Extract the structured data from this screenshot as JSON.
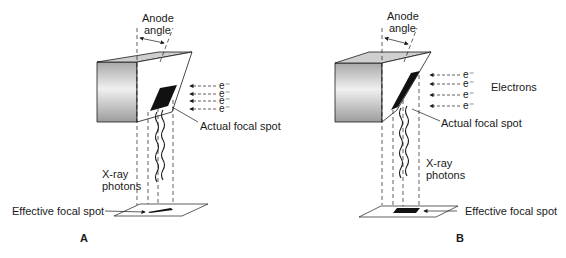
{
  "figure": {
    "panels": [
      {
        "id": "A",
        "panel_label": "A",
        "anode_angle_label_line1": "Anode",
        "anode_angle_label_line2": "angle",
        "electron_symbol": "e⁻",
        "electron_count": 4,
        "actual_focal_spot_label": "Actual focal spot",
        "xray_label_line1": "X-ray",
        "xray_label_line2": "photons",
        "effective_focal_spot_label": "Effective focal spot"
      },
      {
        "id": "B",
        "panel_label": "B",
        "anode_angle_label_line1": "Anode",
        "anode_angle_label_line2": "angle",
        "electron_symbol": "e⁻",
        "electron_count": 4,
        "electrons_label": "Electrons",
        "actual_focal_spot_label": "Actual focal spot",
        "xray_label_line1": "X-ray",
        "xray_label_line2": "photons",
        "effective_focal_spot_label": "Effective focal spot"
      }
    ],
    "colors": {
      "line": "#1a1a1a",
      "focal_spot": "#111111",
      "anode_gradient_light": "#f2f2f2",
      "anode_gradient_dark": "#9a9a9a"
    }
  }
}
